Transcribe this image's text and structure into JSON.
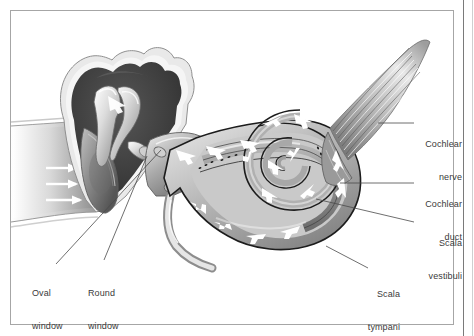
{
  "figure": {
    "style": "grayscale medical illustration",
    "border": {
      "inset_color": "#9a9a9a",
      "edge_color": "#6e6e6e",
      "background": "#ffffff"
    },
    "palette": {
      "outline": "#1a1a1a",
      "cavity_dark": "#3b3b3b",
      "tissue_mid": "#8e8e8e",
      "tissue_light": "#d2d2d2",
      "highlight": "#f2f2f2",
      "arrow_white": "#ffffff",
      "leader_line": "#444444",
      "label_text": "#3a3a3a"
    }
  },
  "labels": [
    {
      "id": "cochlear-nerve",
      "line1": "Cochlear",
      "line2": "nerve",
      "align": "right"
    },
    {
      "id": "cochlear-duct",
      "line1": "Cochlear",
      "line2": "duct",
      "align": "right"
    },
    {
      "id": "scala-vestibuli",
      "line1": "Scala",
      "line2": "vestibuli",
      "align": "right"
    },
    {
      "id": "scala-tympani",
      "line1": "Scala",
      "line2": "tympani",
      "align": "right"
    },
    {
      "id": "oval-window",
      "line1": "Oval",
      "line2": "window",
      "align": "left"
    },
    {
      "id": "round-window",
      "line1": "Round",
      "line2": "window",
      "align": "left"
    }
  ],
  "structures": [
    {
      "id": "ear-canal",
      "name": "external auditory canal"
    },
    {
      "id": "tympanic-membrane",
      "name": "eardrum / tympanic membrane"
    },
    {
      "id": "middle-ear-cavity",
      "name": "tympanic cavity"
    },
    {
      "id": "malleus",
      "name": "malleus"
    },
    {
      "id": "incus",
      "name": "incus"
    },
    {
      "id": "stapes",
      "name": "stapes"
    },
    {
      "id": "oval-window",
      "name": "oval window"
    },
    {
      "id": "round-window",
      "name": "round window"
    },
    {
      "id": "cochlea-spiral",
      "name": "cochlear spiral"
    },
    {
      "id": "cochlear-duct",
      "name": "cochlear duct (scala media)"
    },
    {
      "id": "scala-vestibuli",
      "name": "scala vestibuli"
    },
    {
      "id": "scala-tympani",
      "name": "scala tympani"
    },
    {
      "id": "cochlear-nerve",
      "name": "cochlear nerve fibers"
    },
    {
      "id": "eustachian-tube",
      "name": "eustachian tube"
    }
  ],
  "flow_arrows": {
    "sound_wave_count": 3,
    "sound_wave_direction": "rightward into eardrum",
    "fluid_direction": "inward along scala vestibuli, outward along scala tympani"
  }
}
